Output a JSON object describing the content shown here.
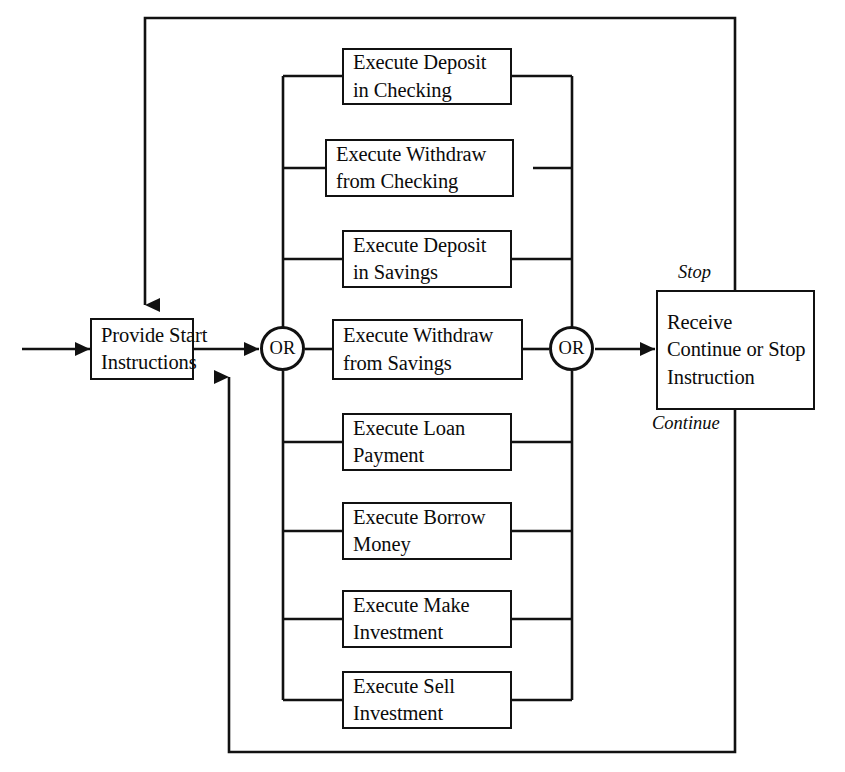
{
  "diagram": {
    "colors": {
      "stroke": "#111111",
      "text": "#0b0b0b",
      "background": "#ffffff"
    },
    "start_node": {
      "label_line1": "Provide Start",
      "label_line2": "Instructions"
    },
    "end_node": {
      "label_line1": "Receive",
      "label_line2": "Continue or Stop",
      "label_line3": "Instruction"
    },
    "or_left": {
      "label": "OR"
    },
    "or_right": {
      "label": "OR"
    },
    "edge_labels": {
      "stop": "Stop",
      "continue": "Continue"
    },
    "processes": [
      {
        "id": "deposit-checking",
        "line1": "Execute Deposit",
        "line2": "in Checking"
      },
      {
        "id": "withdraw-checking",
        "line1": "Execute Withdraw",
        "line2": "from Checking"
      },
      {
        "id": "deposit-savings",
        "line1": "Execute Deposit",
        "line2": "in Savings"
      },
      {
        "id": "withdraw-savings",
        "line1": "Execute Withdraw",
        "line2": "from Savings"
      },
      {
        "id": "loan-payment",
        "line1": "Execute Loan",
        "line2": "Payment"
      },
      {
        "id": "borrow-money",
        "line1": "Execute Borrow",
        "line2": "Money"
      },
      {
        "id": "make-investment",
        "line1": "Execute Make",
        "line2": "Investment"
      },
      {
        "id": "sell-investment",
        "line1": "Execute Sell",
        "line2": "Investment"
      }
    ]
  }
}
